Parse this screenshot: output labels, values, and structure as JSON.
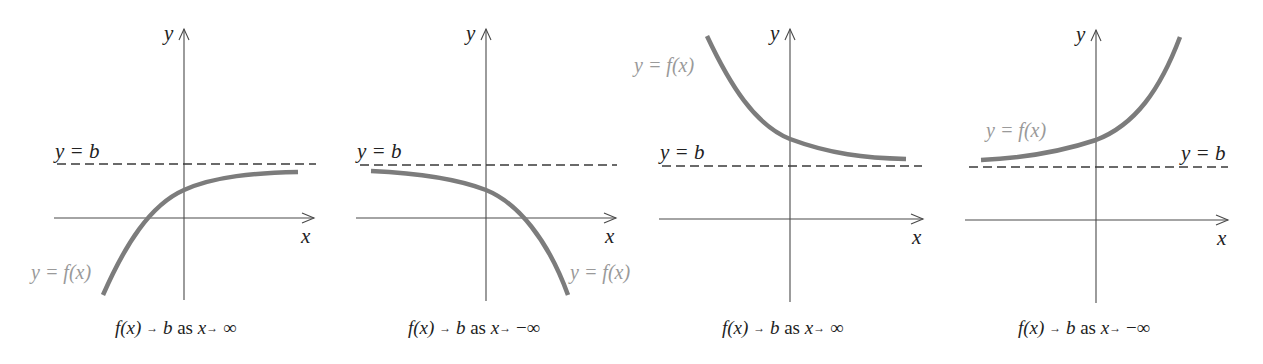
{
  "figure": {
    "colors": {
      "axis": "#4a4a4a",
      "asymptote": "#3a3a3a",
      "curve": "#7c7c7c",
      "curve_label": "#9a9a9a",
      "text": "#222222"
    },
    "panels": [
      {
        "y_axis_label": "y",
        "x_axis_label": "x",
        "asymptote_label": "y = b",
        "curve_label": "y = f(x)",
        "caption": {
          "fx": "f(x)",
          "arrow1": "→",
          "b": "b",
          "as": "as",
          "x": "x",
          "arrow2": "→",
          "limit": "∞"
        },
        "behavior": "increasing, concave down, approaches y=b from below as x→∞"
      },
      {
        "y_axis_label": "y",
        "x_axis_label": "x",
        "asymptote_label": "y = b",
        "curve_label": "y = f(x)",
        "caption": {
          "fx": "f(x)",
          "arrow1": "→",
          "b": "b",
          "as": "as",
          "x": "x",
          "arrow2": "→",
          "limit": "−∞"
        },
        "behavior": "decreasing, concave down, approaches y=b from below as x→−∞"
      },
      {
        "y_axis_label": "y",
        "x_axis_label": "x",
        "asymptote_label": "y = b",
        "curve_label": "y = f(x)",
        "caption": {
          "fx": "f(x)",
          "arrow1": "→",
          "b": "b",
          "as": "as",
          "x": "x",
          "arrow2": "→",
          "limit": "∞"
        },
        "behavior": "decreasing, concave up, approaches y=b from above as x→∞"
      },
      {
        "y_axis_label": "y",
        "x_axis_label": "x",
        "asymptote_label": "y = b",
        "curve_label": "y = f(x)",
        "caption": {
          "fx": "f(x)",
          "arrow1": "→",
          "b": "b",
          "as": "as",
          "x": "x",
          "arrow2": "→",
          "limit": "−∞"
        },
        "behavior": "increasing, concave up, approaches y=b from above as x→−∞"
      }
    ]
  }
}
